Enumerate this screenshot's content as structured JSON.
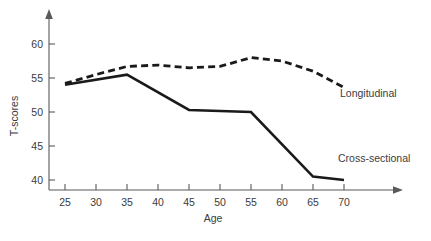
{
  "chart_data": {
    "type": "line",
    "title": "",
    "xlabel": "Age",
    "ylabel": "T-scores",
    "x": [
      25,
      30,
      35,
      40,
      45,
      50,
      55,
      60,
      65,
      70
    ],
    "xlim": [
      22.5,
      73
    ],
    "ylim": [
      38,
      62
    ],
    "xticks": [
      "25",
      "30",
      "35",
      "40",
      "45",
      "50",
      "55",
      "60",
      "65",
      "70"
    ],
    "yticks": [
      "40",
      "45",
      "50",
      "55",
      "60"
    ],
    "grid": false,
    "legend_position": "inline-annotation",
    "series": [
      {
        "name": "Longitudinal",
        "style": "dashed",
        "color": "#1a1a1a",
        "x": [
          25,
          30,
          35,
          40,
          45,
          50,
          55,
          60,
          65,
          70
        ],
        "values": [
          54.2,
          55.5,
          56.7,
          56.9,
          56.5,
          56.7,
          58.0,
          57.5,
          56.0,
          53.6
        ]
      },
      {
        "name": "Cross-sectional",
        "style": "solid",
        "color": "#1a1a1a",
        "x": [
          25,
          35,
          45,
          55,
          65,
          70
        ],
        "values": [
          54.0,
          55.5,
          50.3,
          50.0,
          40.5,
          40.0
        ]
      }
    ],
    "annotations": [
      {
        "text": "Longitudinal",
        "x": 66.5,
        "y": 52.2
      },
      {
        "text": "Cross-sectional",
        "x": 66.0,
        "y": 44.3
      }
    ]
  }
}
